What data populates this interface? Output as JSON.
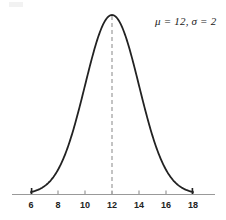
{
  "chart_data": {
    "type": "line",
    "title": "",
    "subtitle": "",
    "xlabel": "",
    "ylabel": "",
    "grid": false,
    "legend_position": "none",
    "distribution": "normal",
    "mu": 12,
    "sigma": 2,
    "annotation": "μ = 12, σ = 2",
    "xlim": [
      4.2,
      19.2
    ],
    "ylim": [
      0,
      0.22
    ],
    "xticks": [
      6,
      8,
      10,
      12,
      14,
      16,
      18
    ],
    "xtick_labels": [
      "6",
      "8",
      "10",
      "12",
      "14",
      "16",
      "18"
    ],
    "yticks": [],
    "ytick_labels": [],
    "mean_line": {
      "x": 12,
      "style": "dashed",
      "color": "#aaaaaa"
    },
    "curve_color": "#222222",
    "axis_color": "#999999",
    "x": [
      6,
      6.5,
      7,
      7.5,
      8,
      8.5,
      9,
      9.5,
      10,
      10.5,
      11,
      11.5,
      12,
      12.5,
      13,
      13.5,
      14,
      14.5,
      15,
      15.5,
      16,
      16.5,
      17,
      17.5,
      18
    ],
    "y": [
      0.0022,
      0.0044,
      0.0088,
      0.0158,
      0.027,
      0.0431,
      0.0648,
      0.0914,
      0.121,
      0.1505,
      0.176,
      0.1933,
      0.1995,
      0.1933,
      0.176,
      0.1505,
      0.121,
      0.0914,
      0.0648,
      0.0431,
      0.027,
      0.0158,
      0.0088,
      0.0044,
      0.0022
    ],
    "series": [
      {
        "name": "normal-pdf",
        "values": [
          0.0022,
          0.0044,
          0.0088,
          0.0158,
          0.027,
          0.0431,
          0.0648,
          0.0914,
          0.121,
          0.1505,
          0.176,
          0.1933,
          0.1995,
          0.1933,
          0.176,
          0.1505,
          0.121,
          0.0914,
          0.0648,
          0.0431,
          0.027,
          0.0158,
          0.0088,
          0.0044,
          0.0022
        ]
      }
    ]
  },
  "axis": {
    "tick_labels": [
      "6",
      "8",
      "10",
      "12",
      "14",
      "16",
      "18"
    ]
  },
  "annotation": {
    "text": "μ = 12, σ = 2"
  }
}
